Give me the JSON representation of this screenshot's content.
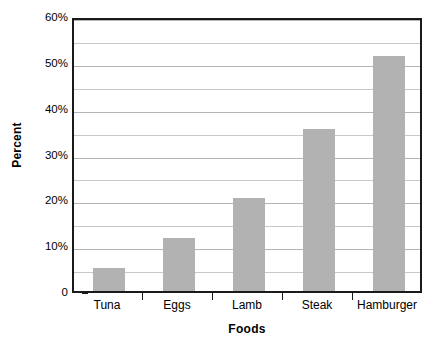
{
  "chart_data": {
    "type": "bar",
    "title": "",
    "subtitle": "",
    "xlabel": "Foods",
    "ylabel": "Percent",
    "categories": [
      "Tuna",
      "Eggs",
      "Lamb",
      "Steak",
      "Hamburger"
    ],
    "values": [
      5.0,
      11.6,
      20.2,
      35.4,
      51.2
    ],
    "series": [
      {
        "name": "Percent",
        "values": [
          5.0,
          11.6,
          20.2,
          35.4,
          51.2
        ]
      }
    ],
    "ylim": [
      0,
      60
    ],
    "ytick_values": [
      0,
      10,
      20,
      30,
      40,
      50,
      60
    ],
    "ytick_labels": [
      "0",
      "10%",
      "20%",
      "30%",
      "40%",
      "50%",
      "60%"
    ],
    "gridlines": {
      "visible": true,
      "major_interval": 10,
      "minor_interval": 5,
      "values": [
        5,
        10,
        15,
        20,
        25,
        30,
        35,
        40,
        45,
        50,
        55,
        60
      ]
    },
    "legend": {
      "visible": false,
      "position": "none",
      "entries": []
    },
    "annotations": [],
    "colors": {
      "bar_fill": "#b2b2b2",
      "gridline": "#c8c8c8",
      "gridline_major": "#b4b4b4",
      "axis": "#1a1a1a",
      "background": "#ffffff",
      "text": "#000000"
    }
  }
}
